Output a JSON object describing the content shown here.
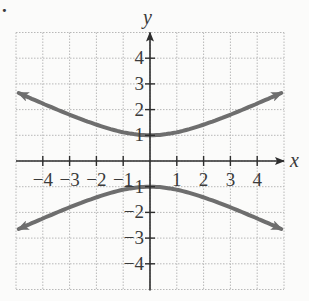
{
  "chart_data": {
    "type": "line",
    "title": "",
    "xlabel": "x",
    "ylabel": "y",
    "xlim": [
      -5,
      5
    ],
    "ylim": [
      -5,
      5
    ],
    "grid": true,
    "x_ticks": [
      -4,
      -3,
      -2,
      -1,
      1,
      2,
      3,
      4
    ],
    "y_ticks": [
      -4,
      -3,
      -2,
      -1,
      1,
      2,
      3,
      4
    ],
    "x_tick_labels": [
      "−4",
      "−3",
      "−2",
      "−1",
      "1",
      "2",
      "3",
      "4"
    ],
    "y_tick_labels": [
      "−4",
      "−3",
      "−2",
      "−1",
      "1",
      "2",
      "3",
      "4"
    ],
    "series": [
      {
        "name": "upper branch",
        "x": [
          -5,
          -4,
          -3,
          -2,
          -1,
          0,
          1,
          2,
          3,
          4,
          5
        ],
        "y": [
          2.69,
          2.24,
          1.8,
          1.41,
          1.12,
          1.0,
          1.12,
          1.41,
          1.8,
          2.24,
          2.69
        ]
      },
      {
        "name": "lower branch",
        "x": [
          -5,
          -4,
          -3,
          -2,
          -1,
          0,
          1,
          2,
          3,
          4,
          5
        ],
        "y": [
          -2.69,
          -2.24,
          -1.8,
          -1.41,
          -1.12,
          -1.0,
          -1.12,
          -1.41,
          -1.8,
          -2.24,
          -2.69
        ]
      }
    ],
    "colors": {
      "curve": "#6e6e6e",
      "axis": "#2e2e2e",
      "grid": "#b8b8b8"
    }
  },
  "labels": {
    "x_axis": "x",
    "y_axis": "y",
    "marker": "."
  }
}
